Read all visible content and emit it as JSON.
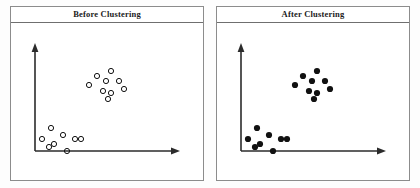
{
  "figure": {
    "background_color": "#fdfdfd",
    "panel_border_color": "#8c8c8c",
    "axis_color": "#2b2b2b",
    "marker_color": "#111111"
  },
  "panels": [
    {
      "id": "before",
      "title": "Before Clustering",
      "marker_style": "hollow",
      "axes": {
        "origin": [
          24,
          128
        ],
        "y_axis_top": [
          24,
          22
        ],
        "x_axis_end": [
          168,
          128
        ],
        "arrowheads": [
          "y-up",
          "x-right"
        ]
      }
    },
    {
      "id": "after",
      "title": "After Clustering",
      "marker_style": "filled",
      "axes": {
        "origin": [
          24,
          128
        ],
        "y_axis_top": [
          24,
          22
        ],
        "x_axis_end": [
          168,
          128
        ],
        "arrowheads": [
          "y-up",
          "x-right"
        ]
      }
    }
  ],
  "chart_data": {
    "type": "scatter",
    "xlabel": "",
    "ylabel": "",
    "grid": false,
    "legend": "none",
    "xlim": [
      0,
      194
    ],
    "ylim": [
      0,
      158
    ],
    "note": "Same 17 points shown twice: left panel unlabeled (hollow markers), right panel clustered (filled markers).",
    "series": [
      {
        "name": "upper-right cluster",
        "count": 9,
        "points": [
          [
            100,
            48
          ],
          [
            86,
            53
          ],
          [
            95,
            58
          ],
          [
            108,
            58
          ],
          [
            78,
            62
          ],
          [
            92,
            68
          ],
          [
            100,
            70
          ],
          [
            113,
            66
          ],
          [
            97,
            76
          ]
        ]
      },
      {
        "name": "lower-left cluster",
        "count": 8,
        "points": [
          [
            40,
            105
          ],
          [
            52,
            112
          ],
          [
            31,
            116
          ],
          [
            64,
            116
          ],
          [
            70,
            116
          ],
          [
            43,
            121
          ],
          [
            38,
            124
          ],
          [
            56,
            128
          ]
        ]
      }
    ]
  }
}
